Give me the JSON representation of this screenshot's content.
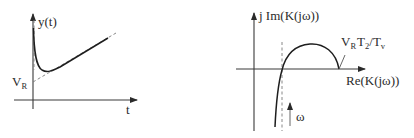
{
  "left_plot": {
    "title": "Step response",
    "y_axis_label": "y(t)",
    "x_axis_label": "t",
    "asymptote_intercept_label": {
      "main": "V",
      "sub": "R"
    },
    "curves": {
      "response": "solid curve y(t)",
      "asymptote": "dashed ramp asymptote"
    }
  },
  "right_plot": {
    "title": "Nyquist locus",
    "imag_axis_label": "j Im(K(jω))",
    "real_axis_label": "Re(K(jω))",
    "intercept_label": {
      "v": "V",
      "v_sub": "R",
      "t2": "T",
      "t2_sub": "2",
      "slash": "/",
      "tv": "T",
      "tv_sub": "v"
    },
    "direction_label": "ω",
    "curves": {
      "locus": "solid curve K(jω)",
      "asymptote": "dashed vertical asymptote"
    }
  },
  "colors": {
    "axis": "#3a3a3a",
    "curve": "#1e1e1e",
    "dashed": "#7a7a7a",
    "text": "#2b2b2b",
    "background": "#ffffff"
  }
}
